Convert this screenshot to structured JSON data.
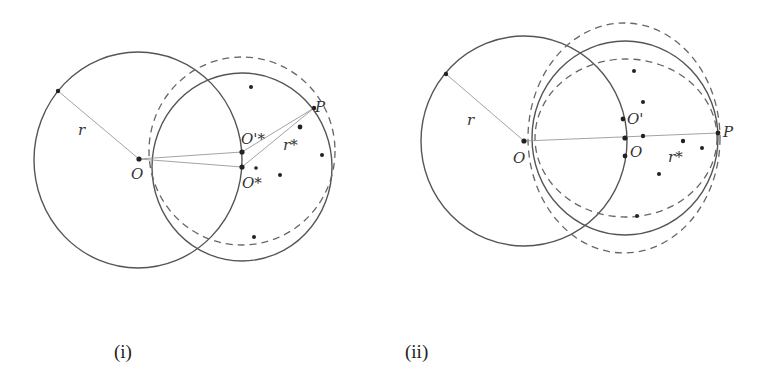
{
  "figure": {
    "panels": [
      {
        "caption": "(i)",
        "labels": {
          "O": "O",
          "O_star": "O*",
          "O_prime_star": "O'*",
          "P": "P",
          "r_left": "r",
          "r_right": "r*"
        }
      },
      {
        "caption": "(ii)",
        "labels": {
          "O": "O",
          "O_lower": "O",
          "O_prime": "O'",
          "P": "P",
          "r_left": "r",
          "r_right": "r*"
        }
      }
    ],
    "colors": {
      "stroke": "#555555",
      "radius_line": "#999999",
      "points": "#222222",
      "background": "#ffffff"
    }
  }
}
